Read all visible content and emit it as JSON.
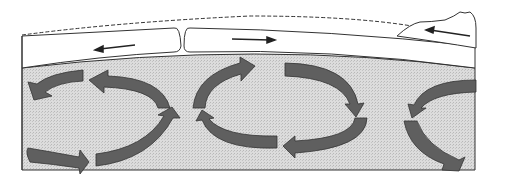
{
  "diagram": {
    "colors": {
      "background": "#ffffff",
      "mantle_fill": "#d4d4d4",
      "lithosphere_fill": "#ffffff",
      "arrow_fill": "#5f5f5f",
      "outline": "#333333"
    },
    "elements": {
      "sea_level": "dashed line",
      "mid_ocean_ridge": "rift at plate boundary",
      "continent": "mountain range at right",
      "plate_motion_arrows": [
        {
          "direction": "left"
        },
        {
          "direction": "right"
        },
        {
          "direction": "left"
        }
      ],
      "convection_cells": 3
    }
  }
}
